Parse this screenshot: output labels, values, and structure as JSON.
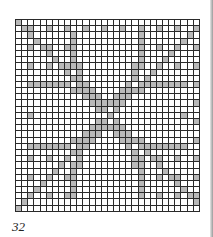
{
  "page": {
    "page_number": "32"
  },
  "chart": {
    "cols": 30,
    "rows": 31,
    "filled_color": "#b9b9b9",
    "empty_color": "#ffffff",
    "grid_line_color": "#2a2a2a",
    "motif": "four hearts pointing inward with diagonal lattice"
  }
}
